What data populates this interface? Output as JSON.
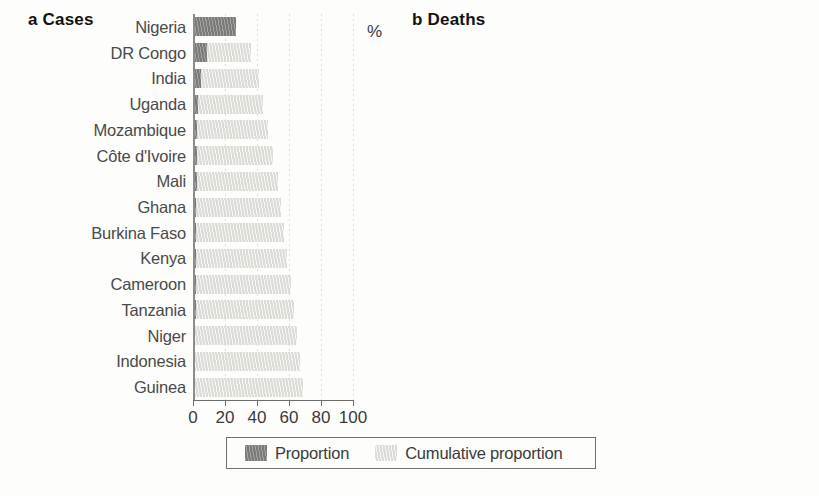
{
  "figure": {
    "background": "#fdfdfc",
    "bar_color_proportion": "#7b7b79",
    "bar_color_cumulative": "#dcdcd7",
    "axis_color": "#6d6d6d"
  },
  "legend": {
    "proportion_label": "Proportion",
    "cumulative_label": "Cumulative proportion"
  },
  "panels": {
    "a": {
      "letter": "a",
      "name": "Cases",
      "label": "a Cases",
      "unit": "%"
    },
    "b": {
      "letter": "b",
      "name": "Deaths",
      "label": "b Deaths",
      "unit": "%"
    }
  },
  "chart_data": [
    {
      "type": "bar",
      "orientation": "horizontal",
      "panel": "a",
      "title": "a Cases",
      "xlabel": "%",
      "ylabel": "",
      "xlim": [
        0,
        100
      ],
      "xticks": [
        0,
        20,
        40,
        60,
        80,
        100
      ],
      "xticklabels": [
        "0",
        "20",
        "40",
        "60",
        "80",
        "100"
      ],
      "grid": "vertical-faint",
      "legend_position": "bottom-center",
      "categories": [
        "Nigeria",
        "DR Congo",
        "India",
        "Uganda",
        "Mozambique",
        "Côte d'Ivoire",
        "Mali",
        "Ghana",
        "Burkina Faso",
        "Kenya",
        "Cameroon",
        "Tanzania",
        "Niger",
        "Indonesia",
        "Guinea"
      ],
      "series": [
        {
          "name": "Proportion",
          "color": "#7b7b79",
          "values": [
            27,
            9,
            5,
            3,
            2.5,
            2.5,
            2.5,
            2,
            2,
            2,
            2,
            2,
            1.5,
            1.5,
            1.5
          ]
        },
        {
          "name": "Cumulative proportion",
          "color": "#dcdcd7",
          "values": [
            27,
            36,
            41,
            44,
            47,
            50,
            53,
            55,
            57,
            59,
            61,
            63,
            65,
            67,
            69
          ]
        }
      ],
      "bar_end_percent": [
        27,
        36,
        41,
        44,
        47,
        50,
        53,
        55,
        57,
        59,
        61,
        63,
        65,
        67,
        69
      ]
    },
    {
      "type": "bar",
      "orientation": "horizontal",
      "panel": "b",
      "title": "b Deaths",
      "xlabel": "%",
      "ylabel": "",
      "xlim": [
        0,
        100
      ],
      "xticks": [
        0,
        20,
        40,
        60,
        80,
        100
      ],
      "xticklabels": [
        "0",
        "20",
        "40",
        "60",
        "80",
        "100"
      ],
      "grid": "vertical-faint",
      "legend_position": "bottom-center",
      "categories": [
        "Nigeria",
        "DR Congo",
        "India",
        "Mali",
        "Tanzania",
        "Mozambique",
        "Burkina Faso",
        "Angola",
        "Côte d'Ivoire",
        "Ghana",
        "Uganda",
        "Niger",
        "Kenya",
        "Guinea",
        "Cameroon"
      ],
      "series": [
        {
          "name": "Proportion",
          "color": "#7b7b79",
          "values": [
            28,
            8,
            4,
            3.5,
            3,
            2.5,
            2.5,
            2,
            2,
            2,
            2,
            2,
            2,
            1.5,
            1.5
          ]
        },
        {
          "name": "Cumulative proportion",
          "color": "#dcdcd7",
          "values": [
            28,
            36,
            40,
            44,
            47,
            50,
            53,
            56,
            58,
            61,
            63,
            65,
            67,
            69,
            71
          ]
        }
      ],
      "bar_end_percent": [
        28,
        36,
        40,
        44,
        47,
        50,
        53,
        56,
        58,
        61,
        63,
        65,
        67,
        69,
        71
      ]
    }
  ]
}
